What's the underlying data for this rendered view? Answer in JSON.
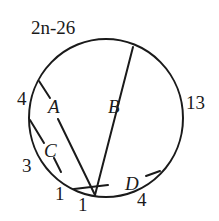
{
  "diagram": {
    "type": "circle-with-chords",
    "arc_labels": {
      "top": "2n-26",
      "upper_left": "4",
      "right": "13",
      "left": "3",
      "bottom_left": "1",
      "bottom": "1",
      "bottom_right": "4"
    },
    "chord_labels": {
      "a": "A",
      "b": "B",
      "c": "C",
      "d": "D"
    },
    "colors": {
      "ink": "#1a1a1a",
      "background": "#ffffff"
    }
  }
}
